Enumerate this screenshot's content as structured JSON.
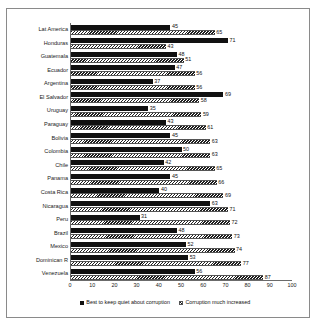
{
  "chart_data": {
    "type": "bar",
    "orientation": "horizontal",
    "title": "",
    "xlabel": "",
    "ylabel": "",
    "xlim": [
      0,
      100
    ],
    "xticks": [
      0,
      10,
      20,
      30,
      40,
      50,
      60,
      70,
      80,
      90,
      100
    ],
    "grid": false,
    "legend_position": "bottom",
    "categories": [
      "Lat America",
      "Honduras",
      "Guatemala",
      "Ecuador",
      "Argentina",
      "El Salvador",
      "Uruguay",
      "Paraguay",
      "Bolivia",
      "Colombia",
      "Chile",
      "Panama",
      "Costa Rica",
      "Nicaragua",
      "Peru",
      "Brazil",
      "Mexico",
      "Dominican R",
      "Venezuela"
    ],
    "series": [
      {
        "name": "Best to keep quiet about corruption",
        "style": "solid",
        "color": "#111111",
        "values": [
          45,
          71,
          48,
          47,
          37,
          69,
          35,
          43,
          45,
          50,
          42,
          45,
          40,
          63,
          31,
          48,
          52,
          53,
          56
        ]
      },
      {
        "name": "Corruption much increased",
        "style": "hatched",
        "color": "#d8d8d8",
        "values": [
          65,
          43,
          51,
          56,
          56,
          58,
          59,
          61,
          63,
          63,
          65,
          66,
          69,
          71,
          72,
          73,
          74,
          77,
          87
        ]
      }
    ]
  },
  "legend": {
    "items": [
      {
        "label": "Best to keep quiet about corruption",
        "style": "solid"
      },
      {
        "label": "Corruption much increased",
        "style": "hatched"
      }
    ]
  }
}
